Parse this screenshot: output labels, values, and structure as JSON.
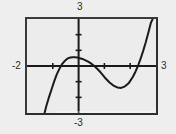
{
  "figure": {
    "kind": "graphing-calculator-screen",
    "background_color": "#eeeeee",
    "screen_fill": "#ececec",
    "frame_color": "#3a3a3a",
    "curve_color": "#1a1a1a"
  },
  "labels": {
    "top": "3",
    "bottom": "-3",
    "left": "-2",
    "right": "3"
  },
  "chart_data": {
    "type": "line",
    "title": "",
    "xlabel": "",
    "ylabel": "",
    "xlim": [
      -2,
      3
    ],
    "ylim": [
      -3,
      3
    ],
    "grid": false,
    "legend": null,
    "axis_labels": {
      "xmin": "-2",
      "xmax": "3",
      "ymin": "-3",
      "ymax": "3"
    },
    "xticks": [
      -1,
      1,
      2
    ],
    "yticks": [
      -2,
      -1,
      1,
      2
    ],
    "annotations": [
      "local maximum near x = -0.2, y = 0.55",
      "local minimum near x = 1.5, y = -1.4",
      "x-intercepts near x = -0.85, x = 0.6, x = 2.3"
    ],
    "series": [
      {
        "name": "curve",
        "color": "#1a1a1a",
        "x": [
          -1.32,
          -1.25,
          -1.15,
          -1.05,
          -0.95,
          -0.85,
          -0.75,
          -0.65,
          -0.55,
          -0.45,
          -0.35,
          -0.25,
          -0.15,
          -0.05,
          0.05,
          0.15,
          0.25,
          0.35,
          0.45,
          0.55,
          0.65,
          0.75,
          0.85,
          0.95,
          1.05,
          1.2,
          1.35,
          1.5,
          1.65,
          1.8,
          1.95,
          2.1,
          2.2,
          2.3,
          2.4,
          2.5,
          2.6,
          2.7,
          2.8,
          2.87
        ],
        "y": [
          -3.0,
          -2.55,
          -2.0,
          -1.5,
          -1.0,
          -0.55,
          -0.2,
          0.1,
          0.3,
          0.45,
          0.53,
          0.56,
          0.56,
          0.54,
          0.5,
          0.45,
          0.38,
          0.3,
          0.2,
          0.08,
          -0.06,
          -0.22,
          -0.4,
          -0.6,
          -0.8,
          -1.05,
          -1.25,
          -1.37,
          -1.4,
          -1.3,
          -1.08,
          -0.7,
          -0.38,
          0.0,
          0.45,
          0.95,
          1.5,
          2.1,
          2.75,
          3.0
        ]
      }
    ]
  }
}
